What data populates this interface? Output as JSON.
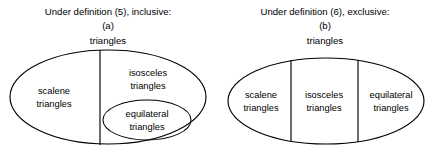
{
  "figure": {
    "panels": [
      {
        "id": "panel-a",
        "caption": "Under definition (5), inclusive:",
        "letter": "(a)",
        "root_label": "triangles",
        "regions": [
          {
            "id": "scalene",
            "line1": "scalene",
            "line2": "triangles"
          },
          {
            "id": "isosceles",
            "line1": "isosceles",
            "line2": "triangles"
          },
          {
            "id": "equilateral",
            "line1": "equilateral",
            "line2": "triangles"
          }
        ]
      },
      {
        "id": "panel-b",
        "caption": "Under definition (6), exclusive:",
        "letter": "(b)",
        "root_label": "triangles",
        "regions": [
          {
            "id": "scalene",
            "line1": "scalene",
            "line2": "triangles"
          },
          {
            "id": "isosceles",
            "line1": "isosceles",
            "line2": "triangles"
          },
          {
            "id": "equilateral",
            "line1": "equilateral",
            "line2": "triangles"
          }
        ]
      }
    ],
    "colors": {
      "stroke": "#000000",
      "text": "#000000",
      "background": "#ffffff"
    }
  }
}
